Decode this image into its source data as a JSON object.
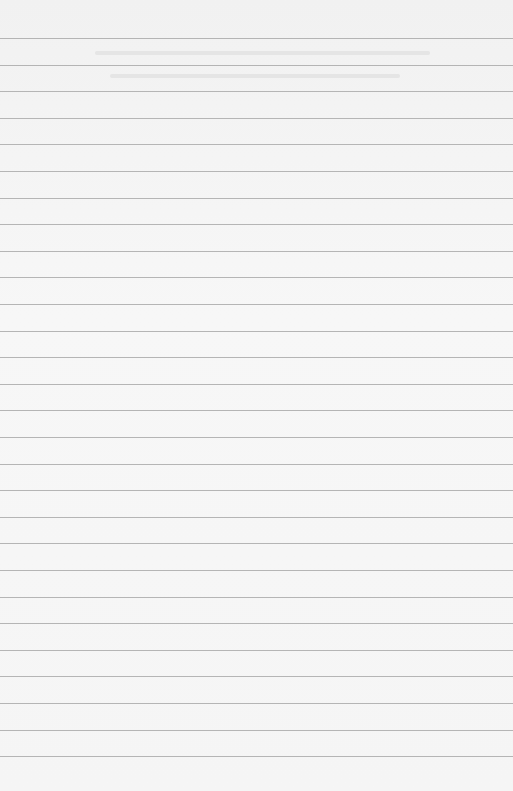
{
  "page": {
    "type": "lined-paper",
    "background_color": "#f4f4f4",
    "rule_color": "#a9a9a9",
    "rule_count": 28,
    "first_rule_y": 38,
    "rule_spacing_px": 26.6
  },
  "note": "Faint show-through text from reverse side is illegible; no readable content."
}
